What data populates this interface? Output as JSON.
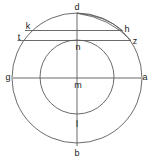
{
  "figure": {
    "background_color": "#ffffff",
    "stroke_color": "#5a5a5a",
    "label_color": "#1a1a1a",
    "canvas": {
      "width": 152,
      "height": 161
    }
  },
  "labels": {
    "d": "d",
    "b": "b",
    "g": "g",
    "a": "a",
    "m": "m",
    "n": "n",
    "l": "l",
    "k": "k",
    "h": "h",
    "t": "t",
    "z": "z"
  },
  "points": [
    {
      "id": "d",
      "label": "d",
      "x": 77,
      "y": 7,
      "role": "top-of-outer-circle"
    },
    {
      "id": "b",
      "label": "b",
      "x": 77,
      "y": 153,
      "role": "bottom-of-outer-circle"
    },
    {
      "id": "g",
      "label": "g",
      "x": 8,
      "y": 77,
      "role": "left-of-outer-circle"
    },
    {
      "id": "a",
      "label": "a",
      "x": 145,
      "y": 77,
      "role": "right-of-outer-circle"
    },
    {
      "id": "m",
      "label": "m",
      "x": 77,
      "y": 84,
      "role": "center"
    },
    {
      "id": "n",
      "label": "n",
      "x": 77,
      "y": 46,
      "role": "top-of-inner-circle"
    },
    {
      "id": "l",
      "label": "l",
      "x": 77,
      "y": 123,
      "role": "bottom-of-inner-circle"
    },
    {
      "id": "k",
      "label": "k",
      "x": 28,
      "y": 27,
      "role": "chord-upper-left-end"
    },
    {
      "id": "h",
      "label": "h",
      "x": 126,
      "y": 29,
      "role": "chord-upper-right-end"
    },
    {
      "id": "t",
      "label": "t",
      "x": 19,
      "y": 38,
      "role": "chord-lower-left-end"
    },
    {
      "id": "z",
      "label": "z",
      "x": 134,
      "y": 41,
      "role": "chord-lower-right-end"
    }
  ],
  "shapes": {
    "outer_circle": {
      "cx": 77,
      "cy": 78,
      "r": 65
    },
    "inner_circle": {
      "cx": 77,
      "cy": 77,
      "r": 37
    },
    "vertical_diameter": {
      "x1": 77,
      "y1": 13,
      "x2": 77,
      "y2": 146,
      "from": "d",
      "to": "b"
    },
    "horizontal_diameter": {
      "x1": 13,
      "y1": 78,
      "x2": 141,
      "y2": 78,
      "from": "g",
      "to": "a"
    },
    "chord_kh": {
      "x1": 25,
      "y1": 31,
      "x2": 122,
      "y2": 31,
      "from": "k",
      "to": "h"
    },
    "chord_tz": {
      "x1": 18,
      "y1": 41,
      "x2": 131,
      "y2": 41,
      "from": "t",
      "to": "z"
    },
    "arc_d_to_h": {
      "from": "d",
      "to": "h",
      "sx": 77,
      "sy": 13,
      "ex": 122,
      "ey": 31
    },
    "arc_d_to_z": {
      "from": "d",
      "to": "z",
      "sx": 77,
      "sy": 13,
      "ex": 131,
      "ey": 41
    }
  }
}
